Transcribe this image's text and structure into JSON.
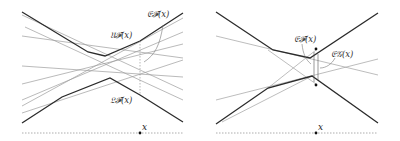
{
  "figure": {
    "left_panel": {
      "labels": {
        "envelope": "𝔈𝓕(x)",
        "upper": "𝔘𝓕(x)",
        "lower": "𝔏𝓕(x)",
        "axis_point": "x"
      },
      "colors": {
        "envelope": "#2b2b2b",
        "lines": "#9a9a9a",
        "baseline": "#8a8a8a"
      }
    },
    "right_panel": {
      "labels": {
        "envelope_F": "𝔈𝓕(x)",
        "envelope_G": "𝔈𝒢(x)",
        "axis_point": "x"
      },
      "colors": {
        "envelope": "#2b2b2b",
        "lines": "#a0a0a0",
        "baseline": "#8a8a8a"
      }
    }
  }
}
